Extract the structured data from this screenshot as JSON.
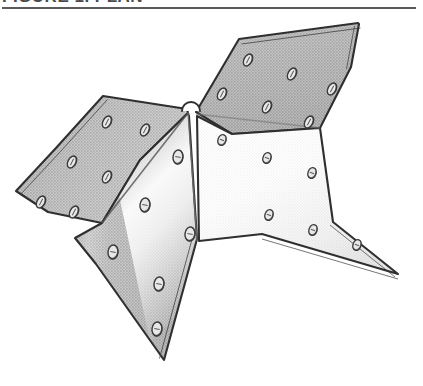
{
  "figure": {
    "title": "FIGURE 1. PLAN",
    "rule_color": "#5b5b5b",
    "caption_color": "#4a4a4a",
    "background": "#ffffff"
  },
  "drawing": {
    "name": "sheet-metal-folded-bracket-connector-plate",
    "description": "Isometric line drawing of a four-winged folded sheet-metal connector bracket perforated with bolt holes",
    "canvas": {
      "width": 423,
      "height": 374
    },
    "colors": {
      "edge": "#2f2f2f",
      "face_gray": "#a9a9a9",
      "face_gray_dark": "#9a9a9a",
      "face_gray_light": "#c4c4c4",
      "face_white": "#fdfdfd",
      "highlight": "#ffffff",
      "hole_outline": "#3a3a3a",
      "hole_fill": "#e8e8e8",
      "hole_shadow": "#6f6f6f"
    },
    "faces": [
      {
        "id": "upper-left-wing",
        "fill": "face_gray",
        "points": "102,211 48,200 16,179 56,136 103,84 187,97 188,101 140,148"
      },
      {
        "id": "upper-right-wing",
        "fill": "face_gray",
        "points": "196,100 239,27 358,11 359,12 351,55 320,116 232,122"
      },
      {
        "id": "lower-left-wing",
        "fill": "face_gray_dark",
        "points": "102,211 140,148 188,101 189,104 197,227 164,348 96,252 75,226"
      },
      {
        "id": "lower-right-wing",
        "fill": "face_white",
        "points": "197,104 232,122 320,116 333,210 398,262 262,222 199,229"
      }
    ],
    "fold_lines": [
      {
        "id": "center-vertical-fold",
        "from": [
          188,
          100
        ],
        "to": [
          197,
          229
        ]
      },
      {
        "id": "left-diagonal-fold",
        "from": [
          188,
          101
        ],
        "to": [
          102,
          211
        ]
      },
      {
        "id": "right-diagonal-fold",
        "from": [
          196,
          102
        ],
        "to": [
          320,
          116
        ]
      }
    ],
    "notch": {
      "id": "apex-semicircular-notch",
      "center": [
        191,
        99
      ],
      "radius": 9
    },
    "holes": [
      {
        "face": "upper-left-wing",
        "cx": 107,
        "cy": 110,
        "rx": 6.5,
        "ry": 4.0,
        "rot": -62
      },
      {
        "face": "upper-left-wing",
        "cx": 145,
        "cy": 118,
        "rx": 6.5,
        "ry": 4.0,
        "rot": -62
      },
      {
        "face": "upper-left-wing",
        "cx": 72,
        "cy": 150,
        "rx": 6.5,
        "ry": 4.0,
        "rot": -62
      },
      {
        "face": "upper-left-wing",
        "cx": 107,
        "cy": 165,
        "rx": 6.5,
        "ry": 4.0,
        "rot": -62
      },
      {
        "face": "upper-left-wing",
        "cx": 41,
        "cy": 190,
        "rx": 6.5,
        "ry": 4.0,
        "rot": -62
      },
      {
        "face": "upper-left-wing",
        "cx": 74,
        "cy": 200,
        "rx": 6.5,
        "ry": 4.0,
        "rot": -62
      },
      {
        "face": "upper-right-wing",
        "cx": 248,
        "cy": 48,
        "rx": 6.5,
        "ry": 4.0,
        "rot": -62
      },
      {
        "face": "upper-right-wing",
        "cx": 292,
        "cy": 62,
        "rx": 6.5,
        "ry": 4.0,
        "rot": -62
      },
      {
        "face": "upper-right-wing",
        "cx": 332,
        "cy": 77,
        "rx": 6.5,
        "ry": 4.0,
        "rot": -62
      },
      {
        "face": "upper-right-wing",
        "cx": 222,
        "cy": 82,
        "rx": 6.5,
        "ry": 4.0,
        "rot": -62
      },
      {
        "face": "upper-right-wing",
        "cx": 267,
        "cy": 95,
        "rx": 6.5,
        "ry": 4.0,
        "rot": -62
      },
      {
        "face": "upper-right-wing",
        "cx": 309,
        "cy": 110,
        "rx": 6.5,
        "ry": 4.0,
        "rot": -62
      },
      {
        "face": "lower-left-wing",
        "cx": 178,
        "cy": 145,
        "rx": 5.0,
        "ry": 7.0,
        "rot": 8
      },
      {
        "face": "lower-left-wing",
        "cx": 145,
        "cy": 193,
        "rx": 5.0,
        "ry": 7.0,
        "rot": 8
      },
      {
        "face": "lower-left-wing",
        "cx": 113,
        "cy": 240,
        "rx": 5.0,
        "ry": 7.0,
        "rot": 8
      },
      {
        "face": "lower-left-wing",
        "cx": 190,
        "cy": 222,
        "rx": 5.0,
        "ry": 7.0,
        "rot": 8
      },
      {
        "face": "lower-left-wing",
        "cx": 159,
        "cy": 272,
        "rx": 5.0,
        "ry": 7.0,
        "rot": 8
      },
      {
        "face": "lower-left-wing",
        "cx": 157,
        "cy": 317,
        "rx": 5.0,
        "ry": 7.0,
        "rot": 8
      },
      {
        "face": "lower-right-wing",
        "cx": 222,
        "cy": 128,
        "rx": 4.0,
        "ry": 5.5,
        "rot": 20
      },
      {
        "face": "lower-right-wing",
        "cx": 267,
        "cy": 146,
        "rx": 4.0,
        "ry": 5.5,
        "rot": 20
      },
      {
        "face": "lower-right-wing",
        "cx": 312,
        "cy": 161,
        "rx": 4.0,
        "ry": 5.5,
        "rot": 20
      },
      {
        "face": "lower-right-wing",
        "cx": 269,
        "cy": 203,
        "rx": 4.0,
        "ry": 5.5,
        "rot": 20
      },
      {
        "face": "lower-right-wing",
        "cx": 313,
        "cy": 218,
        "rx": 4.0,
        "ry": 5.5,
        "rot": 20
      },
      {
        "face": "lower-right-wing",
        "cx": 357,
        "cy": 233,
        "rx": 4.0,
        "ry": 5.5,
        "rot": 20
      }
    ]
  }
}
